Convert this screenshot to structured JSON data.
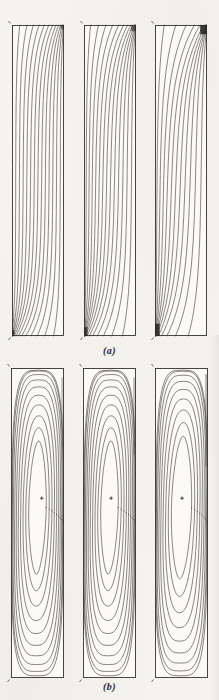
{
  "figure": {
    "caption_a": "(a)",
    "caption_b": "(b)",
    "ink_color": "#3b3933",
    "paper_color": "#f5f4ef"
  },
  "chart_data": [
    {
      "id": "a1",
      "type": "contour",
      "row": "a",
      "content": "isotherms",
      "panel_index": 1,
      "px": {
        "left": 12,
        "top": 25,
        "width": 52,
        "height": 311
      },
      "params": {
        "n_contours": 13,
        "crowd": 1.0,
        "top_exp": 2.2,
        "bot_exp": 3.0,
        "lam_top": 0.11,
        "lam_bot": 0.11
      },
      "blobs": [
        {
          "x": 0.0,
          "y": 0.982,
          "w": 0.05,
          "h": 0.018,
          "o": 0.7
        },
        {
          "x": 0.93,
          "y": 0.0,
          "w": 0.07,
          "h": 0.012,
          "o": 0.5
        }
      ]
    },
    {
      "id": "a2",
      "type": "contour",
      "row": "a",
      "content": "isotherms",
      "panel_index": 2,
      "px": {
        "left": 84,
        "top": 25,
        "width": 52,
        "height": 311
      },
      "params": {
        "n_contours": 13,
        "crowd": 1.2,
        "top_exp": 3.2,
        "bot_exp": 3.4,
        "lam_top": 0.13,
        "lam_bot": 0.13
      },
      "blobs": [
        {
          "x": 0.0,
          "y": 0.972,
          "w": 0.07,
          "h": 0.028,
          "o": 0.8
        },
        {
          "x": 0.9,
          "y": 0.0,
          "w": 0.1,
          "h": 0.02,
          "o": 0.6
        }
      ]
    },
    {
      "id": "a3",
      "type": "contour",
      "row": "a",
      "content": "isotherms",
      "panel_index": 3,
      "px": {
        "left": 155,
        "top": 25,
        "width": 52,
        "height": 311
      },
      "params": {
        "n_contours": 11,
        "crowd": 1.35,
        "top_exp": 5.5,
        "bot_exp": 3.8,
        "lam_top": 0.16,
        "lam_bot": 0.15
      },
      "blobs": [
        {
          "x": 0.0,
          "y": 0.96,
          "w": 0.09,
          "h": 0.04,
          "o": 0.9
        },
        {
          "x": 0.87,
          "y": 0.0,
          "w": 0.13,
          "h": 0.03,
          "o": 0.9
        }
      ]
    },
    {
      "id": "b1",
      "type": "contour",
      "row": "b",
      "content": "streamlines",
      "panel_index": 1,
      "px": {
        "left": 11,
        "top": 368,
        "width": 53,
        "height": 310
      },
      "params": {
        "n_loops": 10,
        "hw_max": 0.485,
        "hw_min": 0.165,
        "hh_max": 0.493,
        "hh_min": 0.215,
        "exp_outer": 3.8,
        "exp_inner": 1.8,
        "spacing_exp": 1.6,
        "center_y": 0.45,
        "tilt": 0.1
      },
      "marker": {
        "x": 0.58,
        "y": 0.42,
        "symbol": "+"
      },
      "smudges": [
        {
          "x": 0.945,
          "y": 0.03,
          "w": 0.035,
          "h": 0.22,
          "o": 0.3
        }
      ]
    },
    {
      "id": "b2",
      "type": "contour",
      "row": "b",
      "content": "streamlines",
      "panel_index": 2,
      "px": {
        "left": 83,
        "top": 368,
        "width": 53,
        "height": 310
      },
      "params": {
        "n_loops": 10,
        "hw_max": 0.485,
        "hw_min": 0.165,
        "hh_max": 0.493,
        "hh_min": 0.215,
        "exp_outer": 3.8,
        "exp_inner": 1.8,
        "spacing_exp": 1.6,
        "center_y": 0.45,
        "tilt": 0.12
      },
      "marker": {
        "x": 0.53,
        "y": 0.42,
        "symbol": "+"
      },
      "smudges": [
        {
          "x": 0.945,
          "y": 0.03,
          "w": 0.035,
          "h": 0.25,
          "o": 0.35
        }
      ]
    },
    {
      "id": "b3",
      "type": "contour",
      "row": "b",
      "content": "streamlines",
      "panel_index": 3,
      "px": {
        "left": 155,
        "top": 368,
        "width": 53,
        "height": 310
      },
      "params": {
        "n_loops": 9,
        "hw_max": 0.485,
        "hw_min": 0.19,
        "hh_max": 0.493,
        "hh_min": 0.23,
        "exp_outer": 3.8,
        "exp_inner": 1.8,
        "spacing_exp": 1.6,
        "center_y": 0.45,
        "tilt": 0.14
      },
      "marker": {
        "x": 0.51,
        "y": 0.42,
        "symbol": "+"
      },
      "smudges": [
        {
          "x": 0.945,
          "y": 0.02,
          "w": 0.035,
          "h": 0.3,
          "o": 0.4
        }
      ]
    }
  ]
}
